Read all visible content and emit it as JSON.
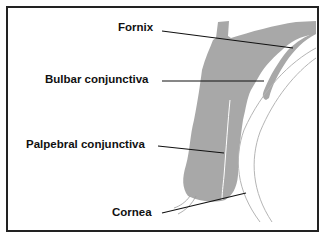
{
  "diagram": {
    "type": "anatomical",
    "labels": [
      {
        "id": "fornix",
        "text": "Fornix"
      },
      {
        "id": "bulbar",
        "text": "Bulbar conjunctiva"
      },
      {
        "id": "palpebral",
        "text": "Palpebral conjunctiva"
      },
      {
        "id": "cornea",
        "text": "Cornea"
      }
    ],
    "colors": {
      "tissue": "#a8a8a8",
      "leader_line": "#111111",
      "cornea_outline": "#b5b5b5",
      "border": "#222222"
    }
  }
}
